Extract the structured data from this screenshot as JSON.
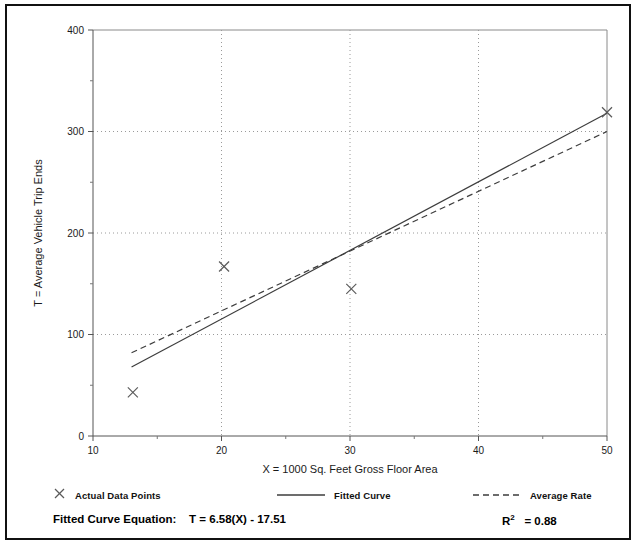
{
  "chart_data": {
    "type": "scatter",
    "title": "",
    "xlabel": "X = 1000 Sq. Feet Gross Floor Area",
    "ylabel": "T = Average Vehicle Trip Ends",
    "xlim": [
      10,
      50
    ],
    "ylim": [
      0,
      400
    ],
    "xticks": [
      10,
      20,
      30,
      40,
      50
    ],
    "xtick_labels": [
      "10",
      "20",
      "30",
      "40",
      "50"
    ],
    "xminor_ticks": [
      15,
      25,
      35,
      45
    ],
    "yticks": [
      0,
      100,
      200,
      300,
      400
    ],
    "ytick_labels": [
      "0",
      "100",
      "200",
      "300",
      "400"
    ],
    "yminor_ticks": [
      50,
      150,
      250,
      350
    ],
    "grid": {
      "x_gridlines": [
        20,
        30,
        40
      ],
      "y_gridlines": [
        100,
        200,
        300
      ],
      "style": "dotted"
    },
    "legend_position": "below-axes",
    "series": [
      {
        "name": "Actual Data Points",
        "type": "scatter",
        "marker": "x",
        "points": [
          {
            "x": 13.1,
            "y": 43
          },
          {
            "x": 20.2,
            "y": 167
          },
          {
            "x": 30.1,
            "y": 145
          },
          {
            "x": 50.0,
            "y": 319
          }
        ]
      },
      {
        "name": "Fitted Curve",
        "type": "line",
        "style": "solid",
        "points": [
          {
            "x": 13.0,
            "y": 68
          },
          {
            "x": 50.0,
            "y": 318
          }
        ]
      },
      {
        "name": "Average Rate",
        "type": "line",
        "style": "dashed",
        "points": [
          {
            "x": 13.0,
            "y": 82
          },
          {
            "x": 50.0,
            "y": 300
          }
        ]
      }
    ],
    "annotations": {
      "fitted_curve_equation_label": "Fitted Curve Equation:",
      "fitted_curve_equation": "T = 6.58(X) - 17.51",
      "r_squared_symbol": "R",
      "r_squared_exponent": "2",
      "r_squared_value": "= 0.88"
    }
  },
  "legend": {
    "items": [
      {
        "label": "Actual Data Points",
        "marker": "x-marker"
      },
      {
        "label": "Fitted Curve",
        "marker": "solid-line"
      },
      {
        "label": "Average Rate",
        "marker": "dashed-line"
      }
    ]
  },
  "colors": {
    "frame": "#111111",
    "axis": "#555555",
    "grid": "#9a9a9a",
    "line": "#3d3d3d",
    "marker": "#5a5a5a",
    "text": "#000000",
    "background": "#ffffff"
  }
}
